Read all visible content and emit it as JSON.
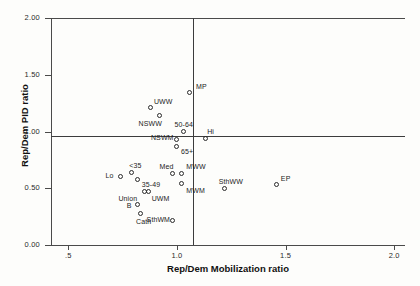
{
  "chart_data": {
    "type": "scatter",
    "title": "",
    "xlabel": "Rep/Dem Mobilization ratio",
    "ylabel": "Rep/Dem PID ratio",
    "xlim": [
      0.42,
      2.05
    ],
    "ylim": [
      0.0,
      2.0
    ],
    "xticks": [
      ".5",
      "1.0",
      "1.5",
      "2.0"
    ],
    "xtick_values": [
      0.5,
      1.0,
      1.5,
      2.0
    ],
    "yticks": [
      "0.00",
      "0.50",
      "1.00",
      "1.50",
      "2.00"
    ],
    "ytick_values": [
      0.0,
      0.5,
      1.0,
      1.5,
      2.0
    ],
    "grid": false,
    "legend": "none",
    "reference_lines": [
      {
        "orientation": "horizontal",
        "value": 1.0
      },
      {
        "orientation": "vertical",
        "value": 1.0
      }
    ],
    "points": [
      {
        "label": "MP",
        "x": 1.06,
        "y": 1.34,
        "label_dx": 6,
        "label_dy": -10
      },
      {
        "label": "UWW",
        "x": 0.88,
        "y": 1.21,
        "label_dx": 3,
        "label_dy": -10
      },
      {
        "label": "NSWW",
        "x": 0.92,
        "y": 1.14,
        "label_dx": -21,
        "label_dy": 4
      },
      {
        "label": "50-64",
        "x": 1.03,
        "y": 1.0,
        "label_dx": -9,
        "label_dy": -11
      },
      {
        "label": "Hi",
        "x": 1.13,
        "y": 0.94,
        "label_dx": 2,
        "label_dy": -10
      },
      {
        "label": "NSWM",
        "x": 1.0,
        "y": 0.93,
        "label_dx": -26,
        "label_dy": -5
      },
      {
        "label": "65+",
        "x": 1.0,
        "y": 0.87,
        "label_dx": 4,
        "label_dy": 2
      },
      {
        "label": "Med",
        "x": 0.98,
        "y": 0.63,
        "label_dx": -13,
        "label_dy": -10
      },
      {
        "label": "MWW",
        "x": 1.02,
        "y": 0.63,
        "label_dx": 5,
        "label_dy": -10
      },
      {
        "label": "MWM",
        "x": 1.02,
        "y": 0.54,
        "label_dx": 5,
        "label_dy": 3
      },
      {
        "label": "<35",
        "x": 0.79,
        "y": 0.64,
        "label_dx": -2,
        "label_dy": -10
      },
      {
        "label": "Lo",
        "x": 0.74,
        "y": 0.6,
        "label_dx": -15,
        "label_dy": -5
      },
      {
        "label": "35-49",
        "x": 0.82,
        "y": 0.58,
        "label_dx": 4,
        "label_dy": 2
      },
      {
        "label": "SthWW",
        "x": 1.22,
        "y": 0.5,
        "label_dx": -6,
        "label_dy": -10
      },
      {
        "label": "EP",
        "x": 1.46,
        "y": 0.53,
        "label_dx": 4,
        "label_dy": -10
      },
      {
        "label": "Union",
        "x": 0.85,
        "y": 0.47,
        "label_dx": -26,
        "label_dy": 3
      },
      {
        "label": "UWM",
        "x": 0.87,
        "y": 0.47,
        "label_dx": 3,
        "label_dy": 3
      },
      {
        "label": "B",
        "x": 0.82,
        "y": 0.36,
        "label_dx": -11,
        "label_dy": -2
      },
      {
        "label": "Cath",
        "x": 0.83,
        "y": 0.28,
        "label_dx": -4,
        "label_dy": 5
      },
      {
        "label": "SthWM",
        "x": 0.98,
        "y": 0.22,
        "label_dx": -26,
        "label_dy": -4
      }
    ]
  }
}
